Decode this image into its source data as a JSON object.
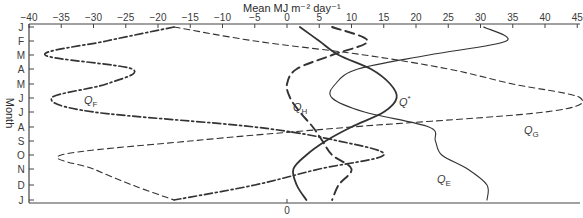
{
  "chart_data": {
    "type": "line",
    "orientation": "vertical-months",
    "title": "",
    "xlabel": "Mean MJ m⁻² day⁻¹",
    "ylabel": "Month",
    "xlim": [
      -40,
      45
    ],
    "x_ticks": [
      -40,
      -35,
      -30,
      -25,
      -20,
      -15,
      -10,
      -5,
      0,
      5,
      10,
      15,
      20,
      25,
      30,
      35,
      40,
      45
    ],
    "x_tick_labels": [
      "−40",
      "−35",
      "−30",
      "−25",
      "−20",
      "−15",
      "−10",
      "−5",
      "0",
      "5",
      "10",
      "15",
      "20",
      "25",
      "30",
      "35",
      "40",
      "45"
    ],
    "bottom_zero_label": "0",
    "categories": [
      "J",
      "F",
      "M",
      "A",
      "M",
      "J",
      "J",
      "A",
      "S",
      "O",
      "N",
      "D",
      "J"
    ],
    "grid": false,
    "legend": "inline labels",
    "series": [
      {
        "name": "Q*",
        "label_main": "Q",
        "label_sub": "*",
        "style": "solid-thick",
        "values": [
          2,
          5,
          8,
          13,
          16,
          17,
          15,
          10,
          6,
          3,
          1,
          1.5,
          3
        ]
      },
      {
        "name": "Q_H",
        "label_main": "Q",
        "label_sub": "H",
        "style": "long-dash",
        "values": [
          7,
          12.5,
          7,
          1.5,
          0,
          0.5,
          2,
          4,
          5.5,
          7,
          10,
          8,
          7
        ]
      },
      {
        "name": "Q_E",
        "label_main": "Q",
        "label_sub": "E",
        "style": "solid-thin",
        "values": [
          30.5,
          34,
          22,
          11,
          7.5,
          7,
          12,
          22,
          23,
          24,
          28,
          31,
          31
        ]
      },
      {
        "name": "Q_G",
        "label_main": "Q",
        "label_sub": "G",
        "style": "dashed",
        "values": [
          -17.5,
          -5,
          12,
          25,
          35,
          45.5,
          40,
          10,
          -15,
          -35,
          -30,
          -24,
          -17.5
        ]
      },
      {
        "name": "Q_F",
        "label_main": "Q",
        "label_sub": "F",
        "style": "dash-dot",
        "values": [
          -17.5,
          -28,
          -37.5,
          -24,
          -28,
          -36.5,
          -30,
          -5,
          8,
          15,
          5,
          -5,
          -17.5
        ]
      }
    ]
  }
}
